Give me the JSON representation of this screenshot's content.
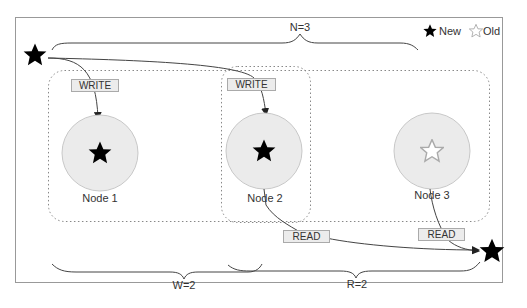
{
  "diagram": {
    "legend": {
      "new_label": "New",
      "old_label": "Old",
      "new_icon": "filled-star-icon",
      "old_icon": "outline-star-icon"
    },
    "braces": {
      "n_label": "N=3",
      "w_label": "W=2",
      "r_label": "R=2"
    },
    "nodes": [
      {
        "label": "Node 1",
        "version": "New"
      },
      {
        "label": "Node 2",
        "version": "New"
      },
      {
        "label": "Node 3",
        "version": "Old"
      }
    ],
    "operations": {
      "write_1": "WRITE",
      "write_2": "WRITE",
      "read_1": "READ",
      "read_2": "READ"
    },
    "colors": {
      "node_fill": "#ebebeb",
      "node_stroke": "#c8c8c8",
      "box_fill": "#ececec",
      "box_stroke": "#aaaaaa",
      "line": "#444444",
      "frame": "#999999"
    }
  }
}
